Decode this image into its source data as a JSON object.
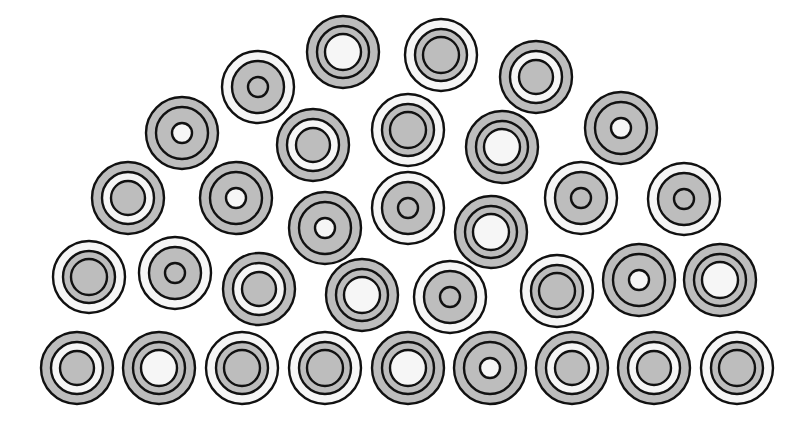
{
  "figure": {
    "colors": {
      "gray": "#bdbdbd",
      "white": "#f6f6f6",
      "stroke": "#111111",
      "background": "#ffffff"
    },
    "variants": {
      "A": {
        "label": "gray rim, white gap, gray core",
        "outer": "gray",
        "middle": "white",
        "inner": "gray",
        "r_outer": 36,
        "r_middle": 26,
        "r_inner": 17
      },
      "B": {
        "label": "gray rim, gray band, white core",
        "outer": "gray",
        "middle": "gray",
        "inner": "white",
        "r_outer": 36,
        "r_middle": 26,
        "r_inner": 18
      },
      "C": {
        "label": "white rim, gray band, gray core",
        "outer": "white",
        "middle": "gray",
        "inner": "gray",
        "r_outer": 36,
        "r_middle": 26,
        "r_inner": 18
      },
      "D": {
        "label": "gray rim, gray band, white dot",
        "outer": "gray",
        "middle": "gray",
        "inner": "white",
        "r_outer": 36,
        "r_middle": 26,
        "r_inner": 10
      },
      "E": {
        "label": "white rim, gray band, gray dot",
        "outer": "white",
        "middle": "gray",
        "inner": "gray",
        "r_outer": 36,
        "r_middle": 26,
        "r_inner": 10
      }
    },
    "circles": [
      {
        "x": 258,
        "y": 87,
        "v": "E"
      },
      {
        "x": 343,
        "y": 52,
        "v": "B"
      },
      {
        "x": 441,
        "y": 55,
        "v": "C"
      },
      {
        "x": 536,
        "y": 77,
        "v": "A"
      },
      {
        "x": 182,
        "y": 133,
        "v": "D"
      },
      {
        "x": 313,
        "y": 145,
        "v": "A"
      },
      {
        "x": 408,
        "y": 130,
        "v": "C"
      },
      {
        "x": 502,
        "y": 147,
        "v": "B"
      },
      {
        "x": 621,
        "y": 128,
        "v": "D"
      },
      {
        "x": 128,
        "y": 198,
        "v": "A"
      },
      {
        "x": 236,
        "y": 198,
        "v": "D"
      },
      {
        "x": 325,
        "y": 228,
        "v": "D"
      },
      {
        "x": 408,
        "y": 208,
        "v": "E"
      },
      {
        "x": 491,
        "y": 232,
        "v": "B"
      },
      {
        "x": 581,
        "y": 198,
        "v": "E"
      },
      {
        "x": 684,
        "y": 199,
        "v": "E"
      },
      {
        "x": 89,
        "y": 277,
        "v": "C"
      },
      {
        "x": 175,
        "y": 273,
        "v": "E"
      },
      {
        "x": 259,
        "y": 289,
        "v": "A"
      },
      {
        "x": 362,
        "y": 295,
        "v": "B"
      },
      {
        "x": 450,
        "y": 297,
        "v": "E"
      },
      {
        "x": 557,
        "y": 291,
        "v": "C"
      },
      {
        "x": 639,
        "y": 280,
        "v": "D"
      },
      {
        "x": 720,
        "y": 280,
        "v": "B"
      },
      {
        "x": 77,
        "y": 368,
        "v": "A"
      },
      {
        "x": 159,
        "y": 368,
        "v": "B"
      },
      {
        "x": 242,
        "y": 368,
        "v": "C"
      },
      {
        "x": 325,
        "y": 368,
        "v": "C"
      },
      {
        "x": 408,
        "y": 368,
        "v": "B"
      },
      {
        "x": 490,
        "y": 368,
        "v": "D"
      },
      {
        "x": 572,
        "y": 368,
        "v": "A"
      },
      {
        "x": 654,
        "y": 368,
        "v": "A"
      },
      {
        "x": 737,
        "y": 368,
        "v": "C"
      }
    ]
  }
}
